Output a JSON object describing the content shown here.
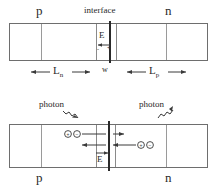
{
  "figure": {
    "top_panel": {
      "label_p": "p",
      "label_interface": "interface",
      "label_n": "n",
      "label_field": "E",
      "sign_minus": "-",
      "sign_plus": "+",
      "label_Ln": "L",
      "label_Ln_sub": "n",
      "label_w": "w",
      "label_Lp": "L",
      "label_Lp_sub": "p"
    },
    "bottom_panel": {
      "label_photon_left": "photon",
      "label_photon_right": "photon",
      "label_p": "p",
      "label_n": "n",
      "label_field": "E",
      "carrier_left_1": "+",
      "carrier_left_2": "-",
      "carrier_right_1": "+",
      "carrier_right_2": "-"
    },
    "colors": {
      "ink": "#2a2a2a",
      "line": "#3a3a3a",
      "box_border": "#6e6e6e",
      "divider": "#9a9a9a",
      "background": "#ffffff"
    }
  }
}
